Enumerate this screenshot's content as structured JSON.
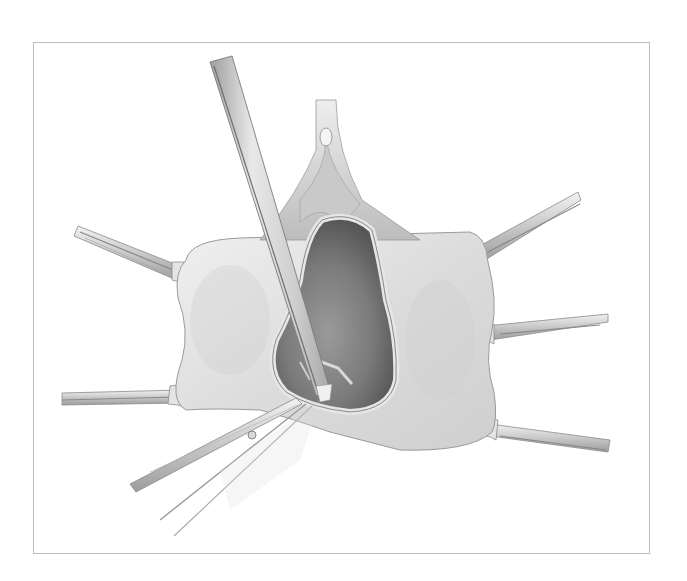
{
  "figure": {
    "type": "surgical-illustration",
    "frame_color": "#bdbdbd",
    "palette": {
      "tissue_light": "#ececec",
      "tissue_mid": "#d6d6d6",
      "tissue_edge": "#9a9a9a",
      "cavity_dark": "#6e6e6e",
      "cavity_mid": "#8c8c8c",
      "instrument_light": "#e6e6e6",
      "instrument_mid": "#c4c4c4",
      "instrument_dark": "#8a8a8a"
    },
    "elements": [
      "tissue-flap",
      "cavity",
      "upper-structure",
      "long-forceps",
      "scissors",
      "retractor-left-upper",
      "retractor-left-lower",
      "retractor-right-upper",
      "retractor-right-middle",
      "retractor-right-lower"
    ]
  }
}
